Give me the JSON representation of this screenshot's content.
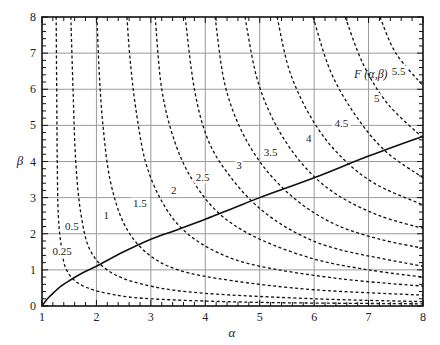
{
  "chart_data": {
    "type": "line",
    "title": "",
    "xlabel": "α",
    "ylabel": "β",
    "xlim": [
      1,
      8
    ],
    "ylim": [
      0,
      8
    ],
    "grid": true,
    "x_ticks": [
      "1",
      "2",
      "3",
      "4",
      "5",
      "6",
      "7",
      "8"
    ],
    "y_ticks": [
      "0",
      "1",
      "2",
      "3",
      "4",
      "5",
      "6",
      "7",
      "8"
    ],
    "annotation": "F (α,β)",
    "contours": [
      {
        "level": "0.25",
        "points": [
          [
            1.26,
            8
          ],
          [
            1.27,
            6
          ],
          [
            1.28,
            4
          ],
          [
            1.3,
            2.5
          ],
          [
            1.36,
            1.6
          ],
          [
            1.45,
            1.0
          ],
          [
            1.7,
            0.6
          ],
          [
            2.2,
            0.35
          ],
          [
            3,
            0.2
          ],
          [
            5,
            0.1
          ],
          [
            8,
            0.06
          ]
        ]
      },
      {
        "level": "0.5",
        "points": [
          [
            1.53,
            8
          ],
          [
            1.57,
            6
          ],
          [
            1.62,
            4
          ],
          [
            1.72,
            2.5
          ],
          [
            1.9,
            1.5
          ],
          [
            2.3,
            0.9
          ],
          [
            3,
            0.55
          ],
          [
            4,
            0.35
          ],
          [
            6,
            0.2
          ],
          [
            8,
            0.12
          ]
        ]
      },
      {
        "level": "1",
        "points": [
          [
            2.01,
            8
          ],
          [
            2.05,
            6.5
          ],
          [
            2.12,
            5
          ],
          [
            2.25,
            3.5
          ],
          [
            2.5,
            2.3
          ],
          [
            2.9,
            1.5
          ],
          [
            3.5,
            1.0
          ],
          [
            4.5,
            0.7
          ],
          [
            6,
            0.45
          ],
          [
            8,
            0.3
          ]
        ]
      },
      {
        "level": "1.5",
        "points": [
          [
            2.56,
            8
          ],
          [
            2.62,
            6.8
          ],
          [
            2.72,
            5.5
          ],
          [
            2.9,
            4
          ],
          [
            3.2,
            2.9
          ],
          [
            3.6,
            2.1
          ],
          [
            4.2,
            1.5
          ],
          [
            5,
            1.1
          ],
          [
            6.5,
            0.75
          ],
          [
            8,
            0.55
          ]
        ]
      },
      {
        "level": "2",
        "points": [
          [
            3.08,
            8
          ],
          [
            3.2,
            6
          ],
          [
            3.45,
            4.5
          ],
          [
            3.8,
            3.4
          ],
          [
            4.3,
            2.5
          ],
          [
            5,
            1.85
          ],
          [
            6,
            1.3
          ],
          [
            7,
            1.0
          ],
          [
            8,
            0.8
          ]
        ]
      },
      {
        "level": "2.5",
        "points": [
          [
            3.63,
            8
          ],
          [
            3.8,
            6
          ],
          [
            4.05,
            4.6
          ],
          [
            4.45,
            3.6
          ],
          [
            5,
            2.7
          ],
          [
            5.7,
            2.0
          ],
          [
            6.5,
            1.55
          ],
          [
            8,
            1.1
          ]
        ]
      },
      {
        "level": "3",
        "points": [
          [
            4.18,
            8
          ],
          [
            4.35,
            6.2
          ],
          [
            4.65,
            4.9
          ],
          [
            5.1,
            3.8
          ],
          [
            5.7,
            2.9
          ],
          [
            6.4,
            2.25
          ],
          [
            7.2,
            1.85
          ],
          [
            8,
            1.6
          ]
        ]
      },
      {
        "level": "3.5",
        "points": [
          [
            4.73,
            8
          ],
          [
            4.95,
            6.3
          ],
          [
            5.3,
            5.0
          ],
          [
            5.8,
            3.9
          ],
          [
            6.4,
            3.1
          ],
          [
            7.2,
            2.5
          ],
          [
            8,
            2.15
          ]
        ]
      },
      {
        "level": "4",
        "points": [
          [
            5.32,
            8
          ],
          [
            5.55,
            6.5
          ],
          [
            5.95,
            5.2
          ],
          [
            6.45,
            4.2
          ],
          [
            7.1,
            3.4
          ],
          [
            8,
            2.8
          ]
        ]
      },
      {
        "level": "4.5",
        "points": [
          [
            5.98,
            8
          ],
          [
            6.3,
            6.5
          ],
          [
            6.75,
            5.3
          ],
          [
            7.3,
            4.3
          ],
          [
            8,
            3.55
          ]
        ]
      },
      {
        "level": "5",
        "points": [
          [
            6.57,
            8
          ],
          [
            6.9,
            6.7
          ],
          [
            7.35,
            5.6
          ],
          [
            8,
            4.65
          ]
        ]
      },
      {
        "level": "5.5",
        "points": [
          [
            7.21,
            8
          ],
          [
            7.5,
            7.0
          ],
          [
            8,
            6.1
          ]
        ]
      }
    ],
    "contour_labels": [
      {
        "text": "0.25",
        "at": [
          1.37,
          1.4
        ]
      },
      {
        "text": "0.5",
        "at": [
          1.55,
          2.1
        ]
      },
      {
        "text": "1",
        "at": [
          2.18,
          2.4
        ]
      },
      {
        "text": "1.5",
        "at": [
          2.8,
          2.75
        ]
      },
      {
        "text": "2",
        "at": [
          3.42,
          3.1
        ]
      },
      {
        "text": "2.5",
        "at": [
          3.95,
          3.45
        ]
      },
      {
        "text": "3",
        "at": [
          4.62,
          3.8
        ]
      },
      {
        "text": "3.5",
        "at": [
          5.2,
          4.15
        ]
      },
      {
        "text": "4",
        "at": [
          5.9,
          4.55
        ]
      },
      {
        "text": "4.5",
        "at": [
          6.5,
          4.95
        ]
      },
      {
        "text": "5",
        "at": [
          7.15,
          5.65
        ]
      },
      {
        "text": "5.5",
        "at": [
          7.55,
          6.4
        ]
      }
    ],
    "series": [
      {
        "name": "boundary-curve",
        "points": [
          [
            1,
            0
          ],
          [
            1.1,
            0.2
          ],
          [
            1.2,
            0.35
          ],
          [
            1.35,
            0.55
          ],
          [
            1.5,
            0.7
          ],
          [
            1.75,
            0.92
          ],
          [
            2,
            1.1
          ],
          [
            2.5,
            1.5
          ],
          [
            3,
            1.85
          ],
          [
            3.5,
            2.12
          ],
          [
            4,
            2.4
          ],
          [
            4.5,
            2.7
          ],
          [
            5,
            3.0
          ],
          [
            6,
            3.55
          ],
          [
            7,
            4.15
          ],
          [
            8,
            4.7
          ]
        ]
      }
    ]
  }
}
